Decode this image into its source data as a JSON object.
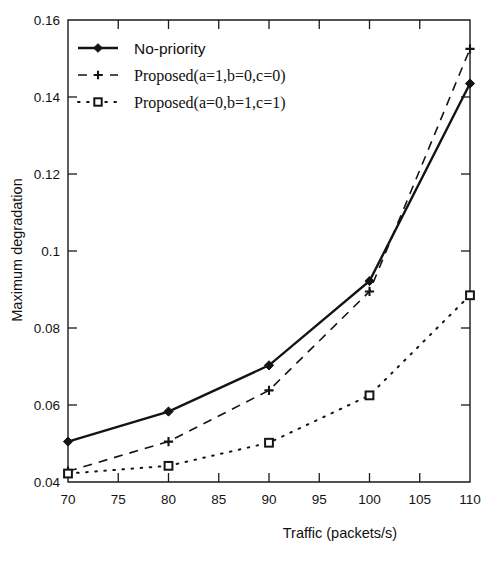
{
  "chart_data": {
    "type": "line",
    "title": "",
    "xlabel": "Traffic (packets/s)",
    "ylabel": "Maximum degradation",
    "xlim": [
      70,
      110
    ],
    "ylim": [
      0.04,
      0.16
    ],
    "xticks": [
      70,
      75,
      80,
      85,
      90,
      95,
      100,
      105,
      110
    ],
    "yticks": [
      0.04,
      0.06,
      0.08,
      0.1,
      0.12,
      0.14,
      0.16
    ],
    "xticklabels": [
      "70",
      "75",
      "80",
      "85",
      "90",
      "95",
      "100",
      "105",
      "110"
    ],
    "yticklabels": [
      "0.04",
      "0.06",
      "0.08",
      "0.1",
      "0.12",
      "0.14",
      "0.16"
    ],
    "grid": false,
    "legend_position": "upper left",
    "x": [
      70,
      80,
      90,
      100,
      110
    ],
    "series": [
      {
        "name": "No-priority",
        "marker": "filled-diamond",
        "linestyle": "solid",
        "color": "#141414",
        "values": [
          0.0505,
          0.0583,
          0.0703,
          0.0922,
          0.1435
        ]
      },
      {
        "name": "Proposed(a=1,b=0,c=0)",
        "marker": "plus",
        "linestyle": "dashed",
        "color": "#141414",
        "values": [
          0.0428,
          0.0505,
          0.0638,
          0.0895,
          0.1525
        ]
      },
      {
        "name": "Proposed(a=0,b=1,c=1)",
        "marker": "open-square",
        "linestyle": "dotted",
        "color": "#141414",
        "values": [
          0.0422,
          0.0442,
          0.0502,
          0.0625,
          0.0885
        ]
      }
    ]
  },
  "legend": {
    "entries": [
      {
        "label": "No-priority",
        "marker": "filled-diamond",
        "linestyle": "solid"
      },
      {
        "label": "Proposed(a=1,b=0,c=0)",
        "marker": "plus",
        "linestyle": "dashed"
      },
      {
        "label": "Proposed(a=0,b=1,c=1)",
        "marker": "open-square",
        "linestyle": "dotted"
      }
    ]
  },
  "colors": {
    "ink": "#141414",
    "background": "#ffffff"
  }
}
